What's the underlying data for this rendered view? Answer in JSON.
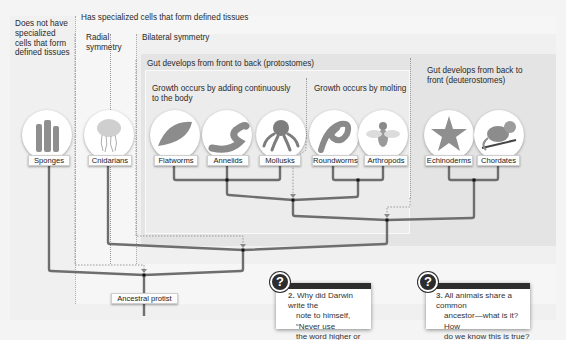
{
  "figure": {
    "groups": {
      "no_tissues": "Does not have specialized cells that form defined tissues",
      "specialized": "Has specialized cells that form defined tissues",
      "radial": "Radial symmetry",
      "bilateral": "Bilateral symmetry",
      "protostomes": "Gut develops from front to back (protostomes)",
      "deuterostomes": "Gut develops from back to front (deuterostomes)",
      "growth_continuous": "Growth occurs by adding continuously to the body",
      "growth_molting": "Growth occurs by molting"
    },
    "taxa": [
      {
        "label": "Sponges",
        "icon": "sponge-icon"
      },
      {
        "label": "Cnidarians",
        "icon": "jellyfish-icon"
      },
      {
        "label": "Flatworms",
        "icon": "flatworm-icon"
      },
      {
        "label": "Annelids",
        "icon": "earthworm-icon"
      },
      {
        "label": "Mollusks",
        "icon": "octopus-icon"
      },
      {
        "label": "Roundworms",
        "icon": "roundworm-icon"
      },
      {
        "label": "Arthropods",
        "icon": "fly-icon"
      },
      {
        "label": "Echinoderms",
        "icon": "starfish-icon"
      },
      {
        "label": "Chordates",
        "icon": "monkey-icon"
      }
    ],
    "root": "Ancestral protist"
  },
  "questions": [
    {
      "number": "2.",
      "text": "Why did Darwin write the note to himself, “Never use the word higher or lower”?",
      "lines": [
        "Why did Darwin write the",
        "note to himself, “Never use",
        "the word higher or lower”?"
      ],
      "icon": "?"
    },
    {
      "number": "3.",
      "text": "All animals share a common ancestor—what is it? How do we know this is true?",
      "lines": [
        "All animals share a common",
        "ancestor—what is it? How",
        "do we know this is true?"
      ],
      "icon": "?"
    }
  ],
  "colors": {
    "branch": "#6e6e6e",
    "node": "#111111",
    "dotted": "#999999",
    "question_bar": "#2d2d2d"
  }
}
